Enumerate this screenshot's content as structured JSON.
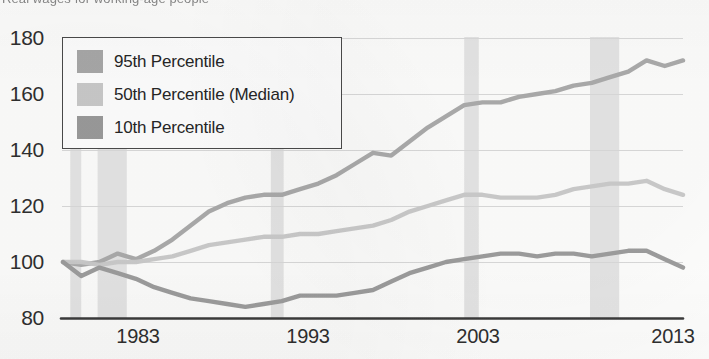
{
  "title_clipped": "Real wages for working-age people",
  "legend": {
    "entries": [
      {
        "label": "95th Percentile",
        "color": "#a8a8a8"
      },
      {
        "label": "50th Percentile (Median)",
        "color": "#c9c9c9"
      },
      {
        "label": "10th Percentile",
        "color": "#9a9a9a"
      }
    ]
  },
  "axes": {
    "y_ticks": [
      "180",
      "160",
      "140",
      "120",
      "100",
      "80"
    ],
    "x_ticks": [
      "1983",
      "1993",
      "2003",
      "2013"
    ]
  },
  "chart_data": {
    "type": "line",
    "title": "Real wages for working-age people",
    "xlabel": "",
    "ylabel": "Index (start = 100)",
    "xlim": [
      1979,
      2013
    ],
    "ylim": [
      80,
      180
    ],
    "y_ticks": [
      80,
      100,
      120,
      140,
      160,
      180
    ],
    "x_ticks": [
      1983,
      1993,
      2003,
      2013
    ],
    "grid": true,
    "legend_position": "top-left",
    "x": [
      1979,
      1980,
      1981,
      1982,
      1983,
      1984,
      1985,
      1986,
      1987,
      1988,
      1989,
      1990,
      1991,
      1992,
      1993,
      1994,
      1995,
      1996,
      1997,
      1998,
      1999,
      2000,
      2001,
      2002,
      2003,
      2004,
      2005,
      2006,
      2007,
      2008,
      2009,
      2010,
      2011,
      2012,
      2013
    ],
    "series": [
      {
        "name": "95th Percentile",
        "color": "#a8a8a8",
        "values": [
          100,
          99,
          100,
          103,
          101,
          104,
          108,
          113,
          118,
          121,
          123,
          124,
          124,
          126,
          128,
          131,
          135,
          139,
          138,
          143,
          148,
          152,
          156,
          157,
          157,
          159,
          160,
          161,
          163,
          164,
          166,
          168,
          172,
          170,
          172
        ]
      },
      {
        "name": "50th Percentile (Median)",
        "color": "#c9c9c9",
        "values": [
          100,
          100,
          99,
          100,
          100,
          101,
          102,
          104,
          106,
          107,
          108,
          109,
          109,
          110,
          110,
          111,
          112,
          113,
          115,
          118,
          120,
          122,
          124,
          124,
          123,
          123,
          123,
          124,
          126,
          127,
          128,
          128,
          129,
          126,
          124
        ]
      },
      {
        "name": "10th Percentile",
        "color": "#9a9a9a",
        "values": [
          100,
          95,
          98,
          96,
          94,
          91,
          89,
          87,
          86,
          85,
          84,
          85,
          86,
          88,
          88,
          88,
          89,
          90,
          93,
          96,
          98,
          100,
          101,
          102,
          103,
          103,
          102,
          103,
          103,
          102,
          103,
          104,
          104,
          101,
          98
        ]
      }
    ],
    "recession_bands": [
      {
        "start": 1979.4,
        "end": 1980.0
      },
      {
        "start": 1980.9,
        "end": 1982.5
      },
      {
        "start": 1990.4,
        "end": 1991.1
      },
      {
        "start": 2001.0,
        "end": 2001.8
      },
      {
        "start": 2007.9,
        "end": 2009.5
      }
    ]
  }
}
